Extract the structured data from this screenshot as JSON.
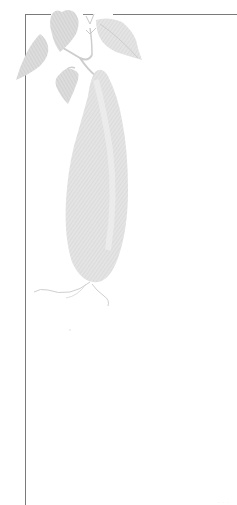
{
  "page": {
    "type": "decorative-book-page",
    "illustration": {
      "subject": "sweet potato engraving",
      "icon": "sweet-potato-illustration",
      "color": "#d6d6d6",
      "leaf_color": "#cfcfcf"
    },
    "frame": {
      "color": "#7a7a7a"
    },
    "footer_text": "· · ·"
  }
}
